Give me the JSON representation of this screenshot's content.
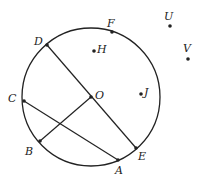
{
  "circle": {
    "cx": 91,
    "cy": 97,
    "r": 69,
    "center_label": "O"
  },
  "points": [
    {
      "id": "D",
      "x": 47,
      "y": 45,
      "lx": 34,
      "ly": 45
    },
    {
      "id": "F",
      "x": 112,
      "y": 32,
      "lx": 107,
      "ly": 27
    },
    {
      "id": "H",
      "x": 94,
      "y": 51,
      "lx": 97,
      "ly": 53
    },
    {
      "id": "O",
      "x": 91,
      "y": 97,
      "lx": 95,
      "ly": 99
    },
    {
      "id": "J",
      "x": 141,
      "y": 94,
      "lx": 144,
      "ly": 96
    },
    {
      "id": "C",
      "x": 24,
      "y": 101,
      "lx": 8,
      "ly": 102
    },
    {
      "id": "B",
      "x": 40,
      "y": 141,
      "lx": 25,
      "ly": 155
    },
    {
      "id": "E",
      "x": 136,
      "y": 148,
      "lx": 138,
      "ly": 160
    },
    {
      "id": "A",
      "x": 118,
      "y": 160,
      "lx": 115,
      "ly": 174
    },
    {
      "id": "U",
      "x": 170,
      "y": 26,
      "lx": 164,
      "ly": 20
    },
    {
      "id": "V",
      "x": 188,
      "y": 59,
      "lx": 183,
      "ly": 52
    }
  ],
  "segments": [
    [
      "D",
      "E"
    ],
    [
      "C",
      "A"
    ],
    [
      "B",
      "O"
    ]
  ]
}
